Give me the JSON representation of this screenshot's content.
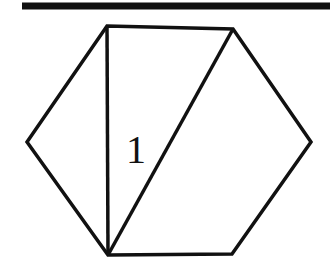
{
  "diagram": {
    "type": "geometry",
    "label": "1",
    "stroke_color": "#111111",
    "background": "#ffffff",
    "top_rule": {
      "x1": 22,
      "x2": 330,
      "y": 6
    },
    "hexagon_vertices": [
      [
        107,
        26
      ],
      [
        233,
        29
      ],
      [
        311,
        142
      ],
      [
        232,
        254
      ],
      [
        108,
        255
      ],
      [
        27,
        142
      ]
    ],
    "diagonals": [
      {
        "from": [
          107,
          26
        ],
        "to": [
          108,
          255
        ]
      },
      {
        "from": [
          233,
          29
        ],
        "to": [
          108,
          255
        ]
      }
    ],
    "label_position": [
      127,
      163
    ]
  }
}
